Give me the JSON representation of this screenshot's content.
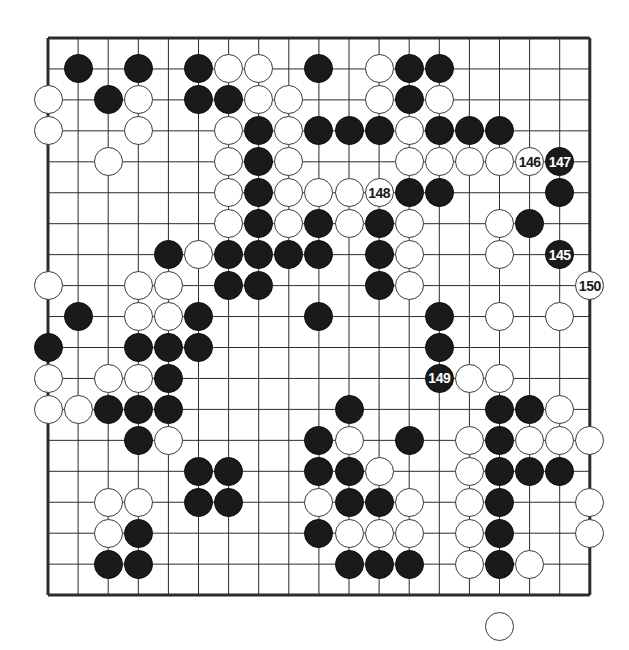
{
  "figure": {
    "kind": "go-game-diagram",
    "board_size": 19,
    "colors": {
      "background": "#ffffff",
      "grid_line": "#2b2b2b",
      "border": "#1a1a1a",
      "black_stone": "#1a1a1a",
      "white_stone": "#ffffff",
      "white_stone_outline": "#3a3a3a",
      "black_label_text": "#ffffff",
      "white_label_text": "#1a1a1a"
    },
    "geometry": {
      "origin_x": 48,
      "origin_y": 38,
      "step_x": 30.1,
      "step_y": 30.95,
      "stone_diameter": 29,
      "border_width": 3
    },
    "star_points": [
      {
        "col": 3,
        "row": 3
      },
      {
        "col": 9,
        "row": 3
      },
      {
        "col": 15,
        "row": 3
      },
      {
        "col": 3,
        "row": 9
      },
      {
        "col": 9,
        "row": 9
      },
      {
        "col": 15,
        "row": 9
      },
      {
        "col": 3,
        "row": 15
      },
      {
        "col": 9,
        "row": 15
      },
      {
        "col": 15,
        "row": 15
      }
    ],
    "visible_star_points": [
      {
        "col": 15,
        "row": 9
      },
      {
        "col": 9,
        "row": 15
      }
    ]
  },
  "move_labels": [
    {
      "number": "145",
      "color": "black",
      "col": 17,
      "row": 7
    },
    {
      "number": "146",
      "color": "white",
      "col": 16,
      "row": 4
    },
    {
      "number": "147",
      "color": "black",
      "col": 17,
      "row": 4
    },
    {
      "number": "148",
      "color": "white",
      "col": 11,
      "row": 5
    },
    {
      "number": "149",
      "color": "black",
      "col": 13,
      "row": 11
    },
    {
      "number": "150",
      "color": "white",
      "col": 18,
      "row": 8
    }
  ],
  "stones": {
    "black": [
      {
        "col": 1,
        "row": 1
      },
      {
        "col": 3,
        "row": 1
      },
      {
        "col": 5,
        "row": 1
      },
      {
        "col": 9,
        "row": 1
      },
      {
        "col": 12,
        "row": 1
      },
      {
        "col": 13,
        "row": 1
      },
      {
        "col": 2,
        "row": 2
      },
      {
        "col": 5,
        "row": 2
      },
      {
        "col": 6,
        "row": 2
      },
      {
        "col": 12,
        "row": 2
      },
      {
        "col": 7,
        "row": 3
      },
      {
        "col": 9,
        "row": 3
      },
      {
        "col": 10,
        "row": 3
      },
      {
        "col": 11,
        "row": 3
      },
      {
        "col": 13,
        "row": 3
      },
      {
        "col": 14,
        "row": 3
      },
      {
        "col": 15,
        "row": 3
      },
      {
        "col": 7,
        "row": 4
      },
      {
        "col": 17,
        "row": 4
      },
      {
        "col": 7,
        "row": 5
      },
      {
        "col": 12,
        "row": 5
      },
      {
        "col": 13,
        "row": 5
      },
      {
        "col": 17,
        "row": 5
      },
      {
        "col": 7,
        "row": 6
      },
      {
        "col": 9,
        "row": 6
      },
      {
        "col": 11,
        "row": 6
      },
      {
        "col": 16,
        "row": 6
      },
      {
        "col": 4,
        "row": 7
      },
      {
        "col": 6,
        "row": 7
      },
      {
        "col": 7,
        "row": 7
      },
      {
        "col": 8,
        "row": 7
      },
      {
        "col": 9,
        "row": 7
      },
      {
        "col": 11,
        "row": 7
      },
      {
        "col": 17,
        "row": 7
      },
      {
        "col": 6,
        "row": 8
      },
      {
        "col": 7,
        "row": 8
      },
      {
        "col": 11,
        "row": 8
      },
      {
        "col": 1,
        "row": 9
      },
      {
        "col": 5,
        "row": 9
      },
      {
        "col": 9,
        "row": 9
      },
      {
        "col": 13,
        "row": 9
      },
      {
        "col": 0,
        "row": 10
      },
      {
        "col": 3,
        "row": 10
      },
      {
        "col": 4,
        "row": 10
      },
      {
        "col": 5,
        "row": 10
      },
      {
        "col": 13,
        "row": 10
      },
      {
        "col": 4,
        "row": 11
      },
      {
        "col": 13,
        "row": 11
      },
      {
        "col": 2,
        "row": 12
      },
      {
        "col": 3,
        "row": 12
      },
      {
        "col": 4,
        "row": 12
      },
      {
        "col": 10,
        "row": 12
      },
      {
        "col": 15,
        "row": 12
      },
      {
        "col": 16,
        "row": 12
      },
      {
        "col": 3,
        "row": 13
      },
      {
        "col": 9,
        "row": 13
      },
      {
        "col": 12,
        "row": 13
      },
      {
        "col": 15,
        "row": 13
      },
      {
        "col": 5,
        "row": 14
      },
      {
        "col": 6,
        "row": 14
      },
      {
        "col": 9,
        "row": 14
      },
      {
        "col": 10,
        "row": 14
      },
      {
        "col": 15,
        "row": 14
      },
      {
        "col": 16,
        "row": 14
      },
      {
        "col": 17,
        "row": 14
      },
      {
        "col": 5,
        "row": 15
      },
      {
        "col": 6,
        "row": 15
      },
      {
        "col": 10,
        "row": 15
      },
      {
        "col": 11,
        "row": 15
      },
      {
        "col": 15,
        "row": 15
      },
      {
        "col": 3,
        "row": 16
      },
      {
        "col": 9,
        "row": 16
      },
      {
        "col": 15,
        "row": 16
      },
      {
        "col": 2,
        "row": 17
      },
      {
        "col": 3,
        "row": 17
      },
      {
        "col": 10,
        "row": 17
      },
      {
        "col": 11,
        "row": 17
      },
      {
        "col": 12,
        "row": 17
      },
      {
        "col": 15,
        "row": 17
      }
    ],
    "white": [
      {
        "col": 6,
        "row": 1
      },
      {
        "col": 7,
        "row": 1
      },
      {
        "col": 11,
        "row": 1
      },
      {
        "col": 0,
        "row": 2
      },
      {
        "col": 3,
        "row": 2
      },
      {
        "col": 7,
        "row": 2
      },
      {
        "col": 8,
        "row": 2
      },
      {
        "col": 11,
        "row": 2
      },
      {
        "col": 13,
        "row": 2
      },
      {
        "col": 0,
        "row": 3
      },
      {
        "col": 3,
        "row": 3
      },
      {
        "col": 6,
        "row": 3
      },
      {
        "col": 8,
        "row": 3
      },
      {
        "col": 12,
        "row": 3
      },
      {
        "col": 2,
        "row": 4
      },
      {
        "col": 6,
        "row": 4
      },
      {
        "col": 8,
        "row": 4
      },
      {
        "col": 12,
        "row": 4
      },
      {
        "col": 13,
        "row": 4
      },
      {
        "col": 14,
        "row": 4
      },
      {
        "col": 15,
        "row": 4
      },
      {
        "col": 16,
        "row": 4
      },
      {
        "col": 6,
        "row": 5
      },
      {
        "col": 8,
        "row": 5
      },
      {
        "col": 9,
        "row": 5
      },
      {
        "col": 10,
        "row": 5
      },
      {
        "col": 11,
        "row": 5
      },
      {
        "col": 6,
        "row": 6
      },
      {
        "col": 8,
        "row": 6
      },
      {
        "col": 10,
        "row": 6
      },
      {
        "col": 12,
        "row": 6
      },
      {
        "col": 15,
        "row": 6
      },
      {
        "col": 5,
        "row": 7
      },
      {
        "col": 12,
        "row": 7
      },
      {
        "col": 15,
        "row": 7
      },
      {
        "col": 0,
        "row": 8
      },
      {
        "col": 3,
        "row": 8
      },
      {
        "col": 4,
        "row": 8
      },
      {
        "col": 12,
        "row": 8
      },
      {
        "col": 18,
        "row": 8
      },
      {
        "col": 3,
        "row": 9
      },
      {
        "col": 4,
        "row": 9
      },
      {
        "col": 15,
        "row": 9
      },
      {
        "col": 17,
        "row": 9
      },
      {
        "col": 0,
        "row": 11
      },
      {
        "col": 2,
        "row": 11
      },
      {
        "col": 3,
        "row": 11
      },
      {
        "col": 14,
        "row": 11
      },
      {
        "col": 15,
        "row": 11
      },
      {
        "col": 0,
        "row": 12
      },
      {
        "col": 1,
        "row": 12
      },
      {
        "col": 17,
        "row": 12
      },
      {
        "col": 4,
        "row": 13
      },
      {
        "col": 10,
        "row": 13
      },
      {
        "col": 14,
        "row": 13
      },
      {
        "col": 16,
        "row": 13
      },
      {
        "col": 17,
        "row": 13
      },
      {
        "col": 18,
        "row": 13
      },
      {
        "col": 11,
        "row": 14
      },
      {
        "col": 14,
        "row": 14
      },
      {
        "col": 2,
        "row": 15
      },
      {
        "col": 3,
        "row": 15
      },
      {
        "col": 9,
        "row": 15
      },
      {
        "col": 12,
        "row": 15
      },
      {
        "col": 14,
        "row": 15
      },
      {
        "col": 18,
        "row": 15
      },
      {
        "col": 2,
        "row": 16
      },
      {
        "col": 10,
        "row": 16
      },
      {
        "col": 11,
        "row": 16
      },
      {
        "col": 12,
        "row": 16
      },
      {
        "col": 14,
        "row": 16
      },
      {
        "col": 18,
        "row": 16
      },
      {
        "col": 14,
        "row": 17
      },
      {
        "col": 16,
        "row": 17
      },
      {
        "col": 15,
        "row": 19
      }
    ]
  }
}
